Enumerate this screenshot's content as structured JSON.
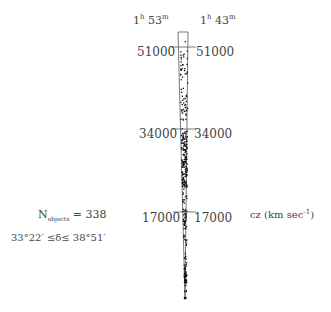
{
  "figure": {
    "ra_left": {
      "h": "1",
      "h_unit": "h",
      "m": "53",
      "m_unit": "m"
    },
    "ra_right": {
      "h": "1",
      "h_unit": "h",
      "m": "43",
      "m_unit": "m"
    },
    "ticks": [
      {
        "value": "51000",
        "y": 48
      },
      {
        "value": "34000",
        "y": 130
      },
      {
        "value": "17000",
        "y": 213
      }
    ],
    "n_label": "N",
    "n_sub": "objects",
    "n_value": "= 338",
    "dec_range": "33°22′ ≤δ≤ 38°51′",
    "axis_label": "cz (km sec",
    "axis_label_exp": "-1",
    "axis_label_close": ")"
  },
  "chart_data": {
    "type": "scatter",
    "xlabel": "RA (1h43m – 1h53m)",
    "ylabel": "cz (km sec^-1)",
    "ylim": [
      0,
      55000
    ],
    "tick_labels": [
      "17000",
      "34000",
      "51000"
    ],
    "annotations": [
      "N_objects = 338",
      "33°22′ ≤δ≤ 38°51′"
    ],
    "n_points": 338,
    "density_regions": [
      {
        "cz_range": [
          3000,
          6000
        ],
        "density": "very high"
      },
      {
        "cz_range": [
          14000,
          17000
        ],
        "density": "high"
      },
      {
        "cz_range": [
          22000,
          33000
        ],
        "density": "very high"
      },
      {
        "cz_range": [
          35000,
          40000
        ],
        "density": "medium"
      },
      {
        "cz_range": [
          44000,
          51000
        ],
        "density": "low"
      }
    ]
  }
}
